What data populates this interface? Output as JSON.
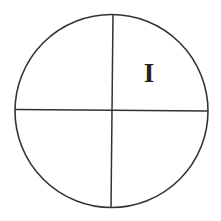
{
  "diagram": {
    "title": "",
    "shape": "circle-divided-into-quadrants",
    "stroke_color": "#333333",
    "background_color": "#ffffff",
    "circle": {
      "cx": 111.5,
      "cy": 111,
      "r": 96.5
    },
    "vertical_divider": {
      "x1": 113,
      "y1": 14.5,
      "x2": 111,
      "y2": 207.5
    },
    "horizontal_divider": {
      "x1": 15,
      "y1": 109.5,
      "x2": 208,
      "y2": 111
    },
    "quadrants": [
      {
        "position": "top-right",
        "label": "I"
      },
      {
        "position": "top-left",
        "label": ""
      },
      {
        "position": "bottom-left",
        "label": ""
      },
      {
        "position": "bottom-right",
        "label": ""
      }
    ]
  }
}
